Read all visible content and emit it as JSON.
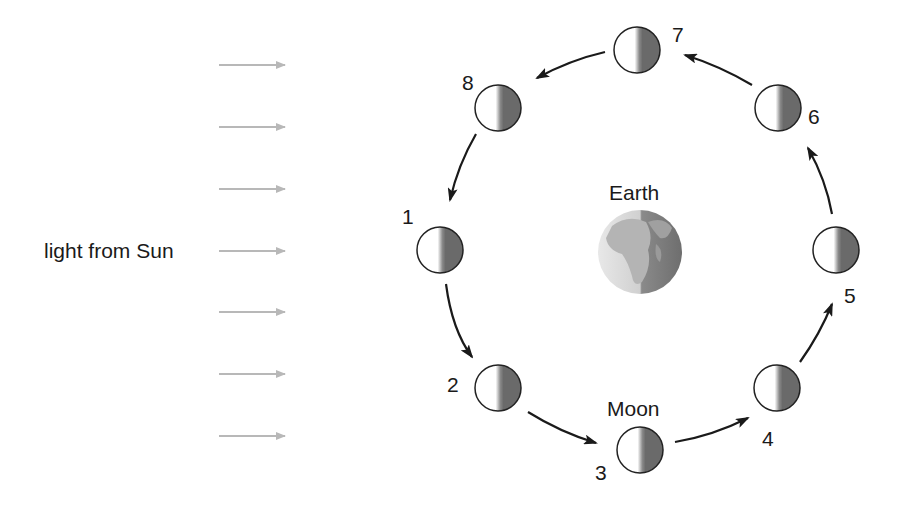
{
  "diagram": {
    "type": "moon-phases-orbit",
    "labels": {
      "sun_light": "light from Sun",
      "earth": "Earth",
      "moon": "Moon"
    },
    "light_arrows": {
      "count": 7,
      "color": "#b8b8b8",
      "y": [
        65,
        127,
        189,
        250,
        312,
        374,
        436
      ]
    },
    "moons": [
      {
        "number": "1",
        "cx": 440,
        "cy": 250
      },
      {
        "number": "2",
        "cx": 498,
        "cy": 388
      },
      {
        "number": "3",
        "cx": 640,
        "cy": 450
      },
      {
        "number": "4",
        "cx": 777,
        "cy": 388
      },
      {
        "number": "5",
        "cx": 836,
        "cy": 250
      },
      {
        "number": "6",
        "cx": 778,
        "cy": 108
      },
      {
        "number": "7",
        "cx": 637,
        "cy": 50
      },
      {
        "number": "8",
        "cx": 498,
        "cy": 108
      }
    ],
    "colors": {
      "lit": "#ffffff",
      "dark": "#6a6a6a",
      "outline": "#222222",
      "orbit_arrow": "#1a1a1a"
    }
  }
}
